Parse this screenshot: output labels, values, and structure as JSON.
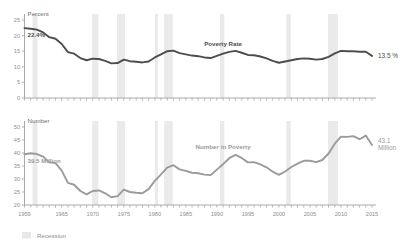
{
  "figure": {
    "width": 404,
    "height": 248,
    "background": "#ffffff",
    "legend": {
      "position": "bottom-left",
      "items": [
        {
          "label": "Recession",
          "color": "#e8e8e8",
          "swatch": "recession-swatch"
        }
      ]
    }
  },
  "colors": {
    "percent_line": "#4d4d4d",
    "number_line": "#9b9b9b",
    "recession_band": "#eaeaea",
    "axis": "#aaaaaa",
    "tick_text": "#8e8e8e",
    "axis_title": "#6f6f6f",
    "annotation_dark": "#4d4d4d",
    "annotation_gray": "#9b9b9b"
  },
  "chart_data": [
    {
      "type": "line",
      "id": "poverty-rate",
      "title": "Poverty Rate",
      "ylabel": "Percent",
      "xlabel": "",
      "ylim": [
        0,
        25
      ],
      "xlim": [
        1959,
        2015
      ],
      "yticks": [
        0,
        5,
        10,
        15,
        20,
        25
      ],
      "ytick_labels": [
        "0",
        "5",
        "10",
        "15",
        "20",
        "25"
      ],
      "xticks": [
        1959,
        1965,
        1970,
        1975,
        1980,
        1985,
        1990,
        1995,
        2000,
        2005,
        2010,
        2015
      ],
      "xtick_labels": [
        "1959",
        "1965",
        "1970",
        "1975",
        "1980",
        "1985",
        "1990",
        "1995",
        "2000",
        "2005",
        "2010",
        "2015"
      ],
      "grid": false,
      "legend_position": "none",
      "annotations": [
        {
          "text": "22.4%",
          "x": 1959,
          "y": 22.4,
          "role": "start-value"
        },
        {
          "text": "13.5 %",
          "x": 2015,
          "y": 13.5,
          "role": "end-value"
        },
        {
          "text": "Poverty Rate",
          "x": 1991,
          "y": 16.6,
          "role": "series-label"
        }
      ],
      "x": [
        1959,
        1960,
        1961,
        1962,
        1963,
        1964,
        1965,
        1966,
        1967,
        1968,
        1969,
        1970,
        1971,
        1972,
        1973,
        1974,
        1975,
        1976,
        1977,
        1978,
        1979,
        1980,
        1981,
        1982,
        1983,
        1984,
        1985,
        1986,
        1987,
        1988,
        1989,
        1990,
        1991,
        1992,
        1993,
        1994,
        1995,
        1996,
        1997,
        1998,
        1999,
        2000,
        2001,
        2002,
        2003,
        2004,
        2005,
        2006,
        2007,
        2008,
        2009,
        2010,
        2011,
        2012,
        2013,
        2014,
        2015
      ],
      "values": [
        22.4,
        22.2,
        21.9,
        21.0,
        19.5,
        19.0,
        17.3,
        14.7,
        14.2,
        12.8,
        12.1,
        12.6,
        12.5,
        11.9,
        11.1,
        11.2,
        12.3,
        11.8,
        11.6,
        11.4,
        11.7,
        13.0,
        14.0,
        15.0,
        15.2,
        14.4,
        14.0,
        13.6,
        13.4,
        13.0,
        12.8,
        13.5,
        14.2,
        14.8,
        15.1,
        14.5,
        13.8,
        13.7,
        13.3,
        12.7,
        11.9,
        11.3,
        11.7,
        12.1,
        12.5,
        12.7,
        12.6,
        12.3,
        12.5,
        13.2,
        14.3,
        15.1,
        15.0,
        15.0,
        14.8,
        14.8,
        13.5
      ],
      "series": [
        {
          "name": "Poverty Rate",
          "unit": "percent",
          "color": "#4d4d4d"
        }
      ]
    },
    {
      "type": "line",
      "id": "number-in-poverty",
      "title": "Number in Poverty",
      "ylabel": "Number",
      "xlabel": "",
      "ylim": [
        20,
        50
      ],
      "xlim": [
        1959,
        2015
      ],
      "yticks": [
        20,
        25,
        30,
        35,
        40,
        45,
        50
      ],
      "ytick_labels": [
        "20",
        "25",
        "30",
        "35",
        "40",
        "45",
        "50"
      ],
      "xticks": [
        1959,
        1965,
        1970,
        1975,
        1980,
        1985,
        1990,
        1995,
        2000,
        2005,
        2010,
        2015
      ],
      "xtick_labels": [
        "1959",
        "1965",
        "1970",
        "1975",
        "1980",
        "1985",
        "1990",
        "1995",
        "2000",
        "2005",
        "2010",
        "2015"
      ],
      "grid": false,
      "legend_position": "none",
      "annotations": [
        {
          "text": "39.5 Million",
          "x": 1959,
          "y": 39.5,
          "role": "start-value"
        },
        {
          "text": "43.1",
          "x": 2015,
          "y": 43.1,
          "role": "end-value-line1"
        },
        {
          "text": "Million",
          "x": 2015,
          "y": 43.1,
          "role": "end-value-line2"
        },
        {
          "text": "Number in Poverty",
          "x": 1991,
          "y": 41.5,
          "role": "series-label"
        }
      ],
      "x": [
        1959,
        1960,
        1961,
        1962,
        1963,
        1964,
        1965,
        1966,
        1967,
        1968,
        1969,
        1970,
        1971,
        1972,
        1973,
        1974,
        1975,
        1976,
        1977,
        1978,
        1979,
        1980,
        1981,
        1982,
        1983,
        1984,
        1985,
        1986,
        1987,
        1988,
        1989,
        1990,
        1991,
        1992,
        1993,
        1994,
        1995,
        1996,
        1997,
        1998,
        1999,
        2000,
        2001,
        2002,
        2003,
        2004,
        2005,
        2006,
        2007,
        2008,
        2009,
        2010,
        2011,
        2012,
        2013,
        2014,
        2015
      ],
      "values": [
        39.5,
        39.9,
        39.6,
        38.6,
        36.4,
        36.1,
        33.2,
        28.5,
        27.8,
        25.4,
        24.1,
        25.4,
        25.6,
        24.5,
        23.0,
        23.4,
        25.9,
        25.0,
        24.7,
        24.5,
        26.1,
        29.3,
        31.8,
        34.4,
        35.3,
        33.7,
        33.1,
        32.4,
        32.2,
        31.7,
        31.5,
        33.6,
        35.7,
        38.0,
        39.3,
        38.1,
        36.4,
        36.5,
        35.6,
        34.5,
        32.8,
        31.6,
        32.9,
        34.6,
        35.9,
        37.0,
        37.0,
        36.5,
        37.3,
        39.8,
        43.6,
        46.3,
        46.2,
        46.5,
        45.3,
        46.7,
        43.1
      ],
      "series": [
        {
          "name": "Number in Poverty",
          "unit": "millions",
          "color": "#9b9b9b"
        }
      ]
    }
  ],
  "recessions": [
    {
      "start": 1960.3,
      "end": 1961.1
    },
    {
      "start": 1969.9,
      "end": 1970.9
    },
    {
      "start": 1973.9,
      "end": 1975.2
    },
    {
      "start": 1980.0,
      "end": 1980.5
    },
    {
      "start": 1981.5,
      "end": 1982.9
    },
    {
      "start": 1990.5,
      "end": 1991.2
    },
    {
      "start": 2001.2,
      "end": 2001.9
    },
    {
      "start": 2007.9,
      "end": 2009.5
    }
  ]
}
